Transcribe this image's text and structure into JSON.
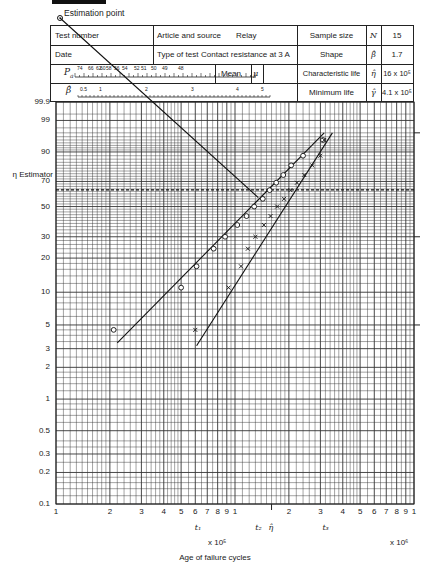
{
  "header": {
    "estimation_point_label": "Estimation point",
    "test_number_label": "Test number",
    "article_label": "Article and source",
    "article_value": "Relay",
    "date_label": "Date",
    "type_label": "Type of test",
    "type_value": "Contact resistance at 3 A",
    "pa_label": "P",
    "pa_sub": "a",
    "pa_scale": [
      "74",
      "66",
      "62",
      "60",
      "58",
      "56",
      "54",
      "52",
      "51",
      "50",
      "49",
      "48"
    ],
    "mean_label": "Mean",
    "mean_symbol": "μ",
    "beta_symbol": "β̂",
    "beta_scale": [
      "0.5",
      "1",
      "2",
      "3",
      "4",
      "5"
    ],
    "right": [
      {
        "label": "Sample size",
        "symbol": "N",
        "value": "15"
      },
      {
        "label": "Shape",
        "symbol": "β̂",
        "value": "1.7"
      },
      {
        "label": "Characteristic life",
        "symbol": "η̂",
        "value": "16 x 10⁵"
      },
      {
        "label": "Minimum life",
        "symbol": "γ̂",
        "value": "4.1 x 10⁵"
      }
    ]
  },
  "chart_data": {
    "type": "scatter",
    "xlabel": "Age of failure cycles",
    "ylabel": "Cumulative percentage failure",
    "x_scale": "log",
    "y_scale": "weibull",
    "x_multipliers": [
      "x 10⁵",
      "x 10⁶"
    ],
    "x_ticks": [
      "1",
      "2",
      "3",
      "4",
      "5",
      "6",
      "7",
      "8",
      "9",
      "1",
      "2",
      "3",
      "4",
      "5",
      "6",
      "7",
      "8",
      "9",
      "1"
    ],
    "y_ticks": [
      99.9,
      99,
      90,
      70,
      50,
      30,
      20,
      10,
      5,
      3,
      2,
      1,
      0.5,
      0.3,
      0.2,
      0.1
    ],
    "eta_estimator_label": "η Estimator",
    "eta_estimator_percent": 63.2,
    "annotations": [
      "t₁",
      "t₂",
      "η̂",
      "t₃"
    ],
    "series": [
      {
        "name": "Raw failure ages (circles)",
        "marker": "circle",
        "points": [
          [
            2.1,
            4.5
          ],
          [
            5.0,
            11
          ],
          [
            6.1,
            17
          ],
          [
            7.6,
            24
          ],
          [
            8.8,
            30
          ],
          [
            10.3,
            37
          ],
          [
            11.6,
            43
          ],
          [
            12.8,
            50
          ],
          [
            14.3,
            56
          ],
          [
            15.6,
            63
          ],
          [
            17.0,
            69
          ],
          [
            18.6,
            75
          ],
          [
            20.6,
            82
          ],
          [
            24.0,
            88
          ],
          [
            31.0,
            95
          ]
        ]
      },
      {
        "name": "Adjusted ages t − γ (crosses)",
        "marker": "x",
        "points": [
          [
            6.0,
            4.5
          ],
          [
            9.2,
            11
          ],
          [
            10.8,
            17
          ],
          [
            11.8,
            24
          ],
          [
            13.0,
            30
          ],
          [
            14.5,
            37
          ],
          [
            15.8,
            43
          ],
          [
            17.2,
            50
          ],
          [
            18.8,
            56
          ],
          [
            20.4,
            63
          ],
          [
            22.2,
            69
          ],
          [
            24.4,
            75
          ],
          [
            27.0,
            82
          ],
          [
            30.0,
            88
          ],
          [
            31.5,
            95
          ]
        ]
      }
    ],
    "fit_lines": [
      {
        "name": "raw fit",
        "from": [
          2.2,
          3.4
        ],
        "to": [
          31.5,
          97
        ]
      },
      {
        "name": "adjusted fit",
        "from": [
          6.1,
          3.2
        ],
        "to": [
          35,
          97
        ]
      },
      {
        "name": "estimation line",
        "from": [
          1.05,
          99.999
        ],
        "to": [
          13.5,
          57
        ]
      }
    ],
    "results": {
      "N": 15,
      "shape": 1.7,
      "characteristic_life": "16 x 10^5",
      "minimum_life": "4.1 x 10^5"
    }
  },
  "right_ticks_percent": [
    97,
    30,
    5
  ]
}
